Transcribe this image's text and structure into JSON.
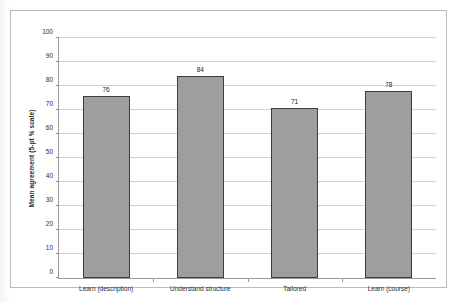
{
  "chart_data": {
    "type": "bar",
    "title": "",
    "xlabel": "",
    "ylabel": "Mean agreement (5-pt % scale)",
    "categories": [
      "Learn (description)",
      "Understand structure",
      "Tailored",
      "Learn (course)"
    ],
    "values": [
      76,
      84,
      71,
      78
    ],
    "data_labels": [
      "76",
      "84",
      "71",
      "78"
    ],
    "ylim": [
      0,
      100
    ],
    "ytick_step": 10,
    "ytick_labels": [
      "100",
      "90",
      "80",
      "70",
      "60",
      "50",
      "40",
      "30",
      "20",
      "10",
      "0"
    ],
    "ytick_values": [
      100,
      90,
      80,
      70,
      60,
      50,
      40,
      30,
      20,
      10,
      0
    ],
    "grid": "horizontal",
    "legend": "none",
    "series": [
      {
        "name": "Mean agreement",
        "values": [
          76,
          84,
          71,
          78
        ]
      }
    ],
    "colors": {
      "bar_fill": "#9e9e9e",
      "bar_border": "#3d3d3d",
      "gridline": "#d2d2d2",
      "axis": "#9a9a9a",
      "frame": "#b9b9b9",
      "text": "#2b2b2b",
      "background": "#ffffff"
    }
  }
}
